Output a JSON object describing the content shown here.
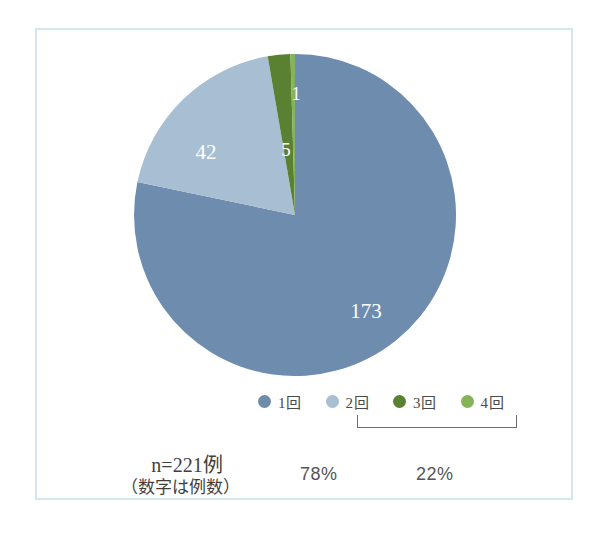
{
  "chart_data": {
    "type": "pie",
    "title": "",
    "labels": [
      "1回",
      "2回",
      "3回",
      "4回"
    ],
    "values": [
      173,
      42,
      5,
      1
    ],
    "value_labels": [
      "173",
      "42",
      "5",
      "1"
    ],
    "colors": [
      "#6e8cae",
      "#a8bed2",
      "#5a8032",
      "#84b358"
    ],
    "total": 221,
    "legend_position": "bottom",
    "grid": false,
    "start_angle_deg": 0,
    "direction": "clockwise",
    "annotations": {
      "percent_left": "78%",
      "percent_right": "22%",
      "bracket_covers": [
        "2回",
        "3回",
        "4回"
      ],
      "sample_note": "n=221例",
      "unit_note": "（数字は例数）"
    }
  },
  "legend": {
    "items": [
      {
        "label": "1回",
        "color": "#6e8cae"
      },
      {
        "label": "2回",
        "color": "#a8bed2"
      },
      {
        "label": "3回",
        "color": "#5a8032"
      },
      {
        "label": "4回",
        "color": "#84b358"
      }
    ]
  },
  "slice_labels": {
    "s0": "173",
    "s1": "42",
    "s2": "5",
    "s3": "1"
  },
  "percents": {
    "left": "78%",
    "right": "22%"
  },
  "note": {
    "sample": "n=221例",
    "caption": "（数字は例数）"
  },
  "colors": {
    "slice_1": "#6e8cae",
    "slice_2": "#a8bed2",
    "slice_3": "#5a8032",
    "slice_4": "#84b358",
    "frame_border": "#d3e7ef",
    "text": "#4a4a4a",
    "bracket": "#6e6e6e",
    "background": "#ffffff"
  }
}
